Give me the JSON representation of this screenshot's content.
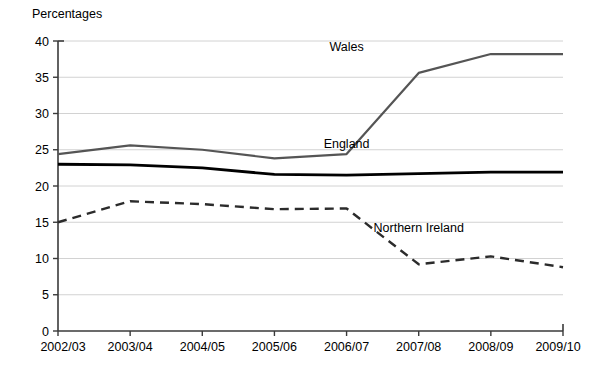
{
  "chart_data": {
    "type": "line",
    "title": "",
    "ylabel": "Percentages",
    "xlabel": "",
    "categories": [
      "2002/03",
      "2003/04",
      "2004/05",
      "2005/06",
      "2006/07",
      "2007/08",
      "2008/09",
      "2009/10"
    ],
    "ylim": [
      0,
      40
    ],
    "ytick_step": 5,
    "yticks": [
      0,
      5,
      10,
      15,
      20,
      25,
      30,
      35,
      40
    ],
    "grid": true,
    "grid_axis": "y",
    "legend_position": "inline-annotations",
    "series": [
      {
        "name": "Wales",
        "values": [
          24.4,
          25.6,
          25.0,
          23.8,
          24.4,
          35.6,
          38.2,
          38.2
        ],
        "color": "#555555",
        "style": "solid",
        "width": 2.2,
        "label_x_category": "2006/07",
        "label_value": 38.6
      },
      {
        "name": "England",
        "values": [
          23.0,
          22.9,
          22.5,
          21.6,
          21.5,
          21.7,
          21.9,
          21.9
        ],
        "color": "#000000",
        "style": "solid",
        "width": 2.8,
        "label_x_category": "2006/07",
        "label_value": 25.2
      },
      {
        "name": "Northern Ireland",
        "values": [
          15.0,
          17.9,
          17.5,
          16.8,
          16.9,
          9.2,
          10.3,
          8.8
        ],
        "color": "#2b2b2b",
        "style": "dashed",
        "width": 2.4,
        "label_x_category": "2007/08",
        "label_value": 13.6
      }
    ],
    "annotations": [
      {
        "text": "Wales",
        "series": "Wales"
      },
      {
        "text": "England",
        "series": "England"
      },
      {
        "text": "Northern Ireland",
        "series": "Northern Ireland"
      }
    ]
  },
  "axis": {
    "y_title": "Percentages",
    "y_tick_labels": [
      "40",
      "35",
      "30",
      "25",
      "20",
      "15",
      "10",
      "5",
      "0"
    ],
    "x_tick_labels": [
      "2002/03",
      "2003/04",
      "2004/05",
      "2005/06",
      "2006/07",
      "2007/08",
      "2008/09",
      "2009/10"
    ]
  },
  "series_labels": {
    "wales": "Wales",
    "england": "England",
    "northern_ireland": "Northern Ireland"
  },
  "colors": {
    "wales": "#555555",
    "england": "#000000",
    "northern_ireland": "#2b2b2b",
    "grid": "#d2d2d2",
    "axis": "#3a3a3a",
    "background": "#ffffff"
  }
}
